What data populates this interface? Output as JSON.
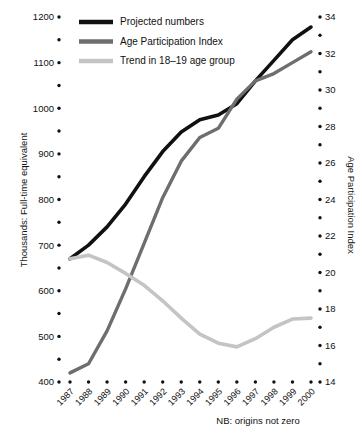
{
  "chart_data": {
    "type": "line",
    "title": "",
    "xlabel": "",
    "ylabel": "Thousands: Full-time equivalent",
    "y2label": "Age Participation Index",
    "note": "NB: origins not zero",
    "grid": false,
    "legend_position": "top-left",
    "categories": [
      "1987",
      "1988",
      "1989",
      "1990",
      "1991",
      "1992",
      "1993",
      "1994",
      "1995",
      "1996",
      "1997",
      "1998",
      "1999",
      "2000"
    ],
    "ylim": [
      400,
      1200
    ],
    "yticks": [
      400,
      500,
      600,
      700,
      800,
      900,
      1000,
      1100,
      1200
    ],
    "yticklabels": [
      "400",
      "500",
      "600",
      "700",
      "800",
      "900",
      "1000",
      "1100",
      "1200"
    ],
    "yminor_step": 50,
    "y2lim": [
      14,
      34
    ],
    "y2ticks": [
      14,
      16,
      18,
      20,
      22,
      24,
      26,
      28,
      30,
      32,
      34
    ],
    "y2ticklabels": [
      "14",
      "16",
      "18",
      "20",
      "22",
      "24",
      "26",
      "28",
      "30",
      "32",
      "34"
    ],
    "y2minor_step": 1,
    "series": [
      {
        "name": "Projected numbers",
        "axis": "left",
        "color": "#111111",
        "width": 3.6,
        "values": [
          670,
          700,
          740,
          790,
          850,
          905,
          948,
          975,
          985,
          1010,
          1060,
          1105,
          1150,
          1178
        ]
      },
      {
        "name": "Age Participation Index",
        "axis": "right",
        "color": "#6e6e6e",
        "width": 3.4,
        "values": [
          14.5,
          15.0,
          16.8,
          19.1,
          21.6,
          24.1,
          26.1,
          27.4,
          27.9,
          29.5,
          30.5,
          30.9,
          31.5,
          32.1
        ]
      },
      {
        "name": "Trend in 18–19 age group",
        "axis": "left",
        "color": "#c4c4c4",
        "width": 3.6,
        "values": [
          670,
          678,
          662,
          638,
          612,
          578,
          540,
          505,
          485,
          477,
          495,
          520,
          538,
          540
        ]
      }
    ]
  },
  "legend": {
    "items": [
      {
        "label": "Projected numbers",
        "color": "#111111"
      },
      {
        "label": "Age Participation Index",
        "color": "#6e6e6e"
      },
      {
        "label": "Trend in 18–19 age group",
        "color": "#c4c4c4"
      }
    ]
  }
}
